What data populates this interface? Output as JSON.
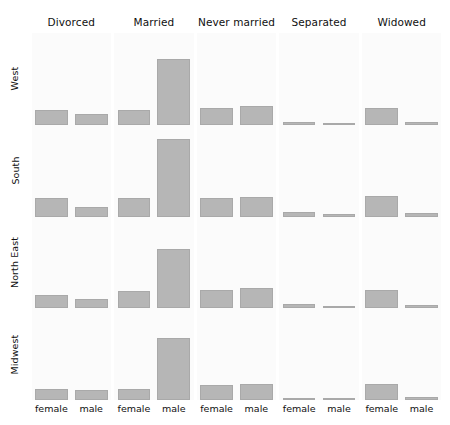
{
  "chart_data": {
    "type": "bar",
    "title": "",
    "subtitle": "",
    "xlabel": "",
    "ylabel": "",
    "grid": false,
    "legend_position": "none",
    "layout": "trellis-lattice 4 rows x 5 columns",
    "ylim": [
      0,
      100
    ],
    "column_categories": [
      "Divorced",
      "Married",
      "Never married",
      "Separated",
      "Widowed"
    ],
    "row_categories": [
      "West",
      "South",
      "North East",
      "Midwest"
    ],
    "x": [
      "female",
      "male"
    ],
    "bar_color": "#b6b6b6",
    "panel_background": "#fbfbfb",
    "panels": [
      {
        "row": "West",
        "cells": [
          {
            "column": "Divorced",
            "values": [
              16,
              12
            ]
          },
          {
            "column": "Married",
            "values": [
              16,
              72
            ]
          },
          {
            "column": "Never married",
            "values": [
              18,
              20
            ]
          },
          {
            "column": "Separated",
            "values": [
              3,
              2
            ]
          },
          {
            "column": "Widowed",
            "values": [
              18,
              3
            ]
          }
        ]
      },
      {
        "row": "South",
        "cells": [
          {
            "column": "Divorced",
            "values": [
              20,
              10
            ]
          },
          {
            "column": "Married",
            "values": [
              20,
              85
            ]
          },
          {
            "column": "Never married",
            "values": [
              20,
              21
            ]
          },
          {
            "column": "Separated",
            "values": [
              5,
              3
            ]
          },
          {
            "column": "Widowed",
            "values": [
              22,
              4
            ]
          }
        ]
      },
      {
        "row": "North East",
        "cells": [
          {
            "column": "Divorced",
            "values": [
              14,
              10
            ]
          },
          {
            "column": "Married",
            "values": [
              19,
              65
            ]
          },
          {
            "column": "Never married",
            "values": [
              20,
              22
            ]
          },
          {
            "column": "Separated",
            "values": [
              5,
              2
            ]
          },
          {
            "column": "Widowed",
            "values": [
              20,
              4
            ]
          }
        ]
      },
      {
        "row": "Midwest",
        "cells": [
          {
            "column": "Divorced",
            "values": [
              12,
              11
            ]
          },
          {
            "column": "Married",
            "values": [
              12,
              68
            ]
          },
          {
            "column": "Never married",
            "values": [
              16,
              17
            ]
          },
          {
            "column": "Separated",
            "values": [
              2,
              2
            ]
          },
          {
            "column": "Widowed",
            "values": [
              17,
              3
            ]
          }
        ]
      }
    ]
  }
}
